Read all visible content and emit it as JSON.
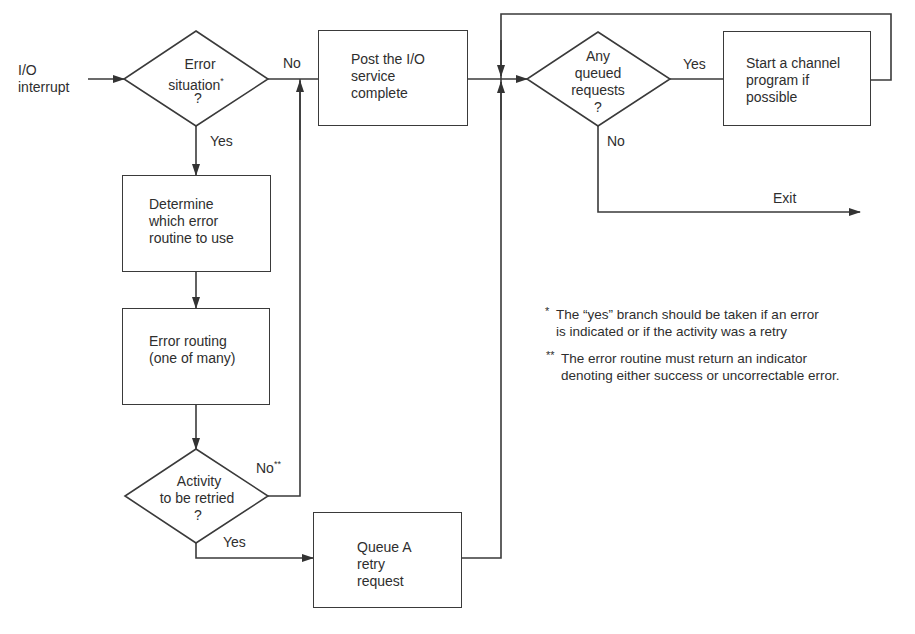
{
  "diagram": {
    "type": "flowchart",
    "start": {
      "label_line1": "I/O",
      "label_line2": "interrupt"
    },
    "decisions": {
      "error_situation": {
        "line1": "Error",
        "line2": "situation",
        "marker": "*",
        "line3": "?",
        "yes": "Yes",
        "no": "No"
      },
      "queued_requests": {
        "line1": "Any",
        "line2": "queued",
        "line3": "requests",
        "line4": "?",
        "yes": "Yes",
        "no": "No"
      },
      "retry": {
        "line1": "Activity",
        "line2": "to be retried",
        "line3": "?",
        "yes": "Yes",
        "no": "No",
        "no_marker": "**"
      }
    },
    "processes": {
      "post_io": {
        "line1": "Post the I/O",
        "line2": "service",
        "line3": "complete"
      },
      "start_channel": {
        "line1": "Start a channel",
        "line2": "program if",
        "line3": "possible"
      },
      "determine": {
        "line1": "Determine",
        "line2": "which error",
        "line3": "routine to use"
      },
      "error_routing": {
        "line1": "Error routing",
        "line2": "(one of many)"
      },
      "queue_retry": {
        "line1": "Queue A",
        "line2": "retry",
        "line3": "request"
      }
    },
    "exit": {
      "label": "Exit"
    },
    "footnotes": [
      {
        "marker": "*",
        "line1": "The “yes” branch should be taken if an error",
        "line2": "is indicated or if the activity was a retry"
      },
      {
        "marker": "**",
        "line1": "The error routine must return an indicator",
        "line2": "denoting either success or uncorrectable error."
      }
    ],
    "colors": {
      "line": "#3a3a3a",
      "text": "#2e2e2e",
      "background": "#ffffff"
    }
  }
}
